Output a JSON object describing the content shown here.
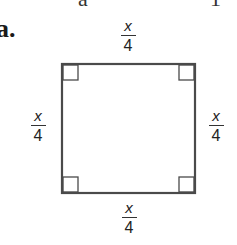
{
  "problem": {
    "label": "a.",
    "top_fragments": [
      "a",
      "1"
    ]
  },
  "figure": {
    "type": "square",
    "stroke_color": "#4a4a4a",
    "right_angle_marks": 4,
    "sides": {
      "top": {
        "numerator": "x",
        "denominator": "4"
      },
      "left": {
        "numerator": "x",
        "denominator": "4"
      },
      "right": {
        "numerator": "x",
        "denominator": "4"
      },
      "bottom": {
        "numerator": "x",
        "denominator": "4"
      }
    }
  }
}
